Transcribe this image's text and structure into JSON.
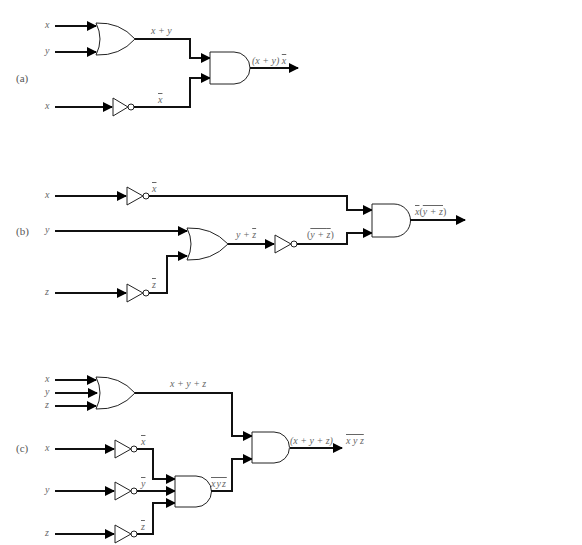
{
  "figure": {
    "parts": [
      {
        "id": "a",
        "label": "(a)",
        "inputs": [
          "x",
          "y",
          "x"
        ],
        "intermediate_labels": [
          "x + y",
          "x̄"
        ],
        "output_label": "(x + y) x̄",
        "gates": [
          "OR(x, y)",
          "NOT(x)",
          "AND(x + y, x̄)"
        ]
      },
      {
        "id": "b",
        "label": "(b)",
        "inputs": [
          "x",
          "y",
          "z"
        ],
        "intermediate_labels": [
          "x̄",
          "z̄",
          "y + z̄",
          "(y + z̄)‾"
        ],
        "output_label": "x̄(y + z̄)‾",
        "gates": [
          "NOT(x)",
          "NOT(z)",
          "OR(y, z̄)",
          "NOT(y + z̄)",
          "AND(x̄, (y + z̄)‾)"
        ]
      },
      {
        "id": "c",
        "label": "(c)",
        "inputs": [
          "x",
          "y",
          "z",
          "x",
          "y",
          "z"
        ],
        "intermediate_labels": [
          "x + y + z",
          "x̄",
          "ȳ",
          "z̄",
          "x̄ȳz̄"
        ],
        "output_label": "(x + y + z) x̄ȳz̄",
        "gates": [
          "OR(x, y, z)",
          "NOT(x)",
          "NOT(y)",
          "NOT(z)",
          "AND(x̄, ȳ, z̄)",
          "AND(x + y + z, x̄ȳz̄)"
        ]
      }
    ],
    "text": {
      "a_label": "(a)",
      "a_in_x": "x",
      "a_in_y": "y",
      "a_in_x2": "x",
      "a_or_out": "x + y",
      "a_not_out": "x",
      "a_out_pre": "(x + y) ",
      "a_out_bar": "x",
      "b_label": "(b)",
      "b_in_x": "x",
      "b_in_y": "y",
      "b_in_z": "z",
      "b_not_x": "x",
      "b_not_z": "z",
      "b_or_pre": "y + ",
      "b_or_bar": "z",
      "b_nor_open": "(",
      "b_nor_inner_pre": "y + ",
      "b_nor_inner_bar": "z",
      "b_nor_close": ")",
      "b_out_bar_x": "x",
      "b_out_inner_pre": "y + ",
      "b_out_inner_bar": "z",
      "c_label": "(c)",
      "c_in_x": "x",
      "c_in_y": "y",
      "c_in_z": "z",
      "c_in_x2": "x",
      "c_in_y2": "y",
      "c_in_z2": "z",
      "c_or_out": "x + y + z",
      "c_not_x": "x",
      "c_not_y": "y",
      "c_not_z": "z",
      "c_and_out": "xyz",
      "c_out1": "(x + y + z)",
      "c_out2": "x y z"
    }
  }
}
